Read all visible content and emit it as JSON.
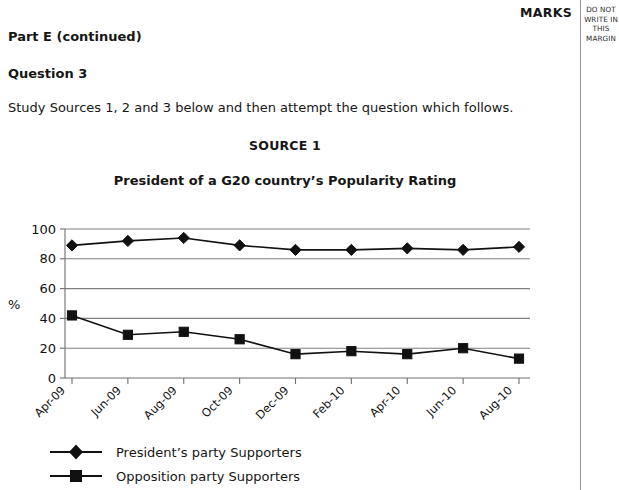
{
  "page": {
    "part_heading": "Part E (continued)",
    "question_heading": "Question 3",
    "instruction": "Study Sources 1, 2 and 3 below and then attempt the question which follows.",
    "source_label": "SOURCE 1"
  },
  "margin": {
    "marks_label": "MARKS",
    "notice_line1": "DO NOT",
    "notice_line2": "WRITE IN",
    "notice_line3": "THIS",
    "notice_line4": "MARGIN"
  },
  "legend": {
    "items": [
      {
        "label": "President’s party Supporters",
        "marker": "diamond",
        "color": "#111111"
      },
      {
        "label": "Opposition party Supporters",
        "marker": "square",
        "color": "#111111"
      }
    ]
  },
  "chart_data": {
    "type": "line",
    "title": "President of a G20 country’s Popularity Rating",
    "xlabel": "",
    "ylabel": "%",
    "ylim": [
      0,
      100
    ],
    "yticks": [
      0,
      20,
      40,
      60,
      80,
      100
    ],
    "ytick_labels": [
      "0",
      "20",
      "40",
      "60",
      "80",
      "100"
    ],
    "grid": "horizontal",
    "legend_position": "bottom-left",
    "categories": [
      "Apr-09",
      "Jun-09",
      "Aug-09",
      "Oct-09",
      "Dec-09",
      "Feb-10",
      "Apr-10",
      "Jun-10",
      "Aug-10"
    ],
    "series": [
      {
        "name": "President’s party Supporters",
        "marker": "diamond",
        "color": "#111111",
        "values": [
          89,
          92,
          94,
          89,
          86,
          86,
          87,
          86,
          88
        ]
      },
      {
        "name": "Opposition party Supporters",
        "marker": "square",
        "color": "#111111",
        "values": [
          42,
          29,
          31,
          26,
          16,
          18,
          16,
          20,
          13
        ]
      }
    ]
  }
}
